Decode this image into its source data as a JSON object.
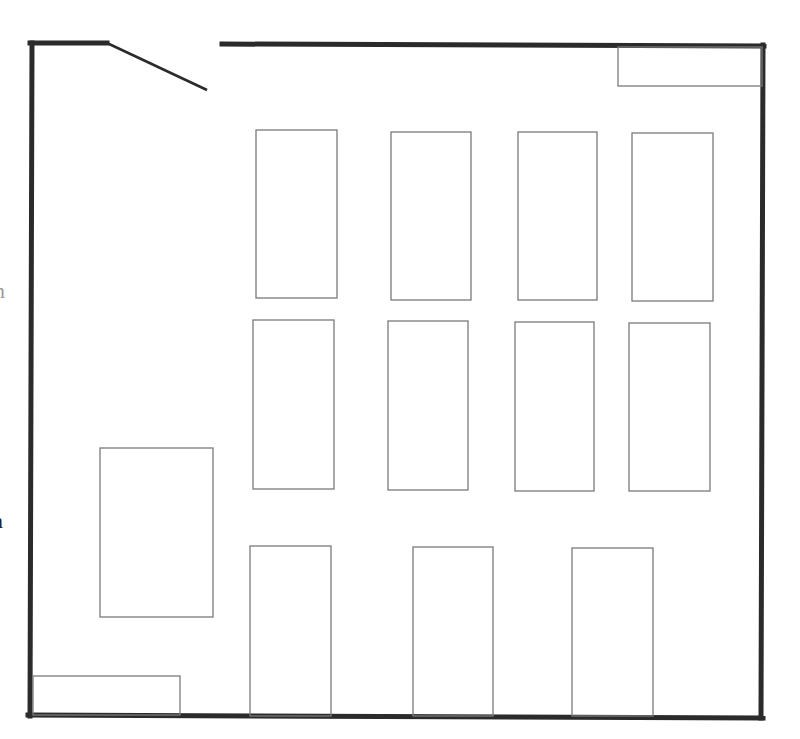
{
  "diagram": {
    "type": "floor-plan",
    "colors": {
      "background": "#ffffff",
      "wall": "#2b2b2b",
      "furniture_stroke": "#7a7a7a",
      "door": "#2b2b2b"
    },
    "walls": [
      {
        "id": "top-left-wall",
        "x1": 30,
        "y1": 43,
        "x2": 107,
        "y2": 43
      },
      {
        "id": "top-right-wall",
        "x1": 222,
        "y1": 44,
        "x2": 764,
        "y2": 46
      },
      {
        "id": "left-wall",
        "x1": 32,
        "y1": 43,
        "x2": 30,
        "y2": 716
      },
      {
        "id": "right-wall",
        "x1": 763,
        "y1": 45,
        "x2": 761,
        "y2": 718
      },
      {
        "id": "bottom-wall",
        "x1": 28,
        "y1": 715,
        "x2": 763,
        "y2": 718
      }
    ],
    "door": {
      "x1": 107,
      "y1": 43,
      "x2": 207,
      "y2": 90
    },
    "tables": [
      {
        "id": "row1-table1",
        "x": 256,
        "y": 130,
        "w": 81,
        "h": 168
      },
      {
        "id": "row1-table2",
        "x": 391,
        "y": 132,
        "w": 80,
        "h": 168
      },
      {
        "id": "row1-table3",
        "x": 518,
        "y": 132,
        "w": 79,
        "h": 168
      },
      {
        "id": "row1-table4",
        "x": 632,
        "y": 133,
        "w": 81,
        "h": 168
      },
      {
        "id": "row2-table1",
        "x": 253,
        "y": 320,
        "w": 81,
        "h": 169
      },
      {
        "id": "row2-table2",
        "x": 388,
        "y": 321,
        "w": 80,
        "h": 169
      },
      {
        "id": "row2-table3",
        "x": 515,
        "y": 322,
        "w": 79,
        "h": 169
      },
      {
        "id": "row2-table4",
        "x": 629,
        "y": 323,
        "w": 81,
        "h": 168
      },
      {
        "id": "row3-table1",
        "x": 250,
        "y": 546,
        "w": 81,
        "h": 170
      },
      {
        "id": "row3-table2",
        "x": 413,
        "y": 547,
        "w": 80,
        "h": 169
      },
      {
        "id": "row3-table3",
        "x": 572,
        "y": 548,
        "w": 81,
        "h": 168
      }
    ],
    "furniture": [
      {
        "id": "large-desk",
        "x": 100,
        "y": 448,
        "w": 113,
        "h": 169
      },
      {
        "id": "top-right-counter",
        "x": 618,
        "y": 47,
        "w": 144,
        "h": 39
      },
      {
        "id": "bottom-left-counter",
        "x": 33,
        "y": 676,
        "w": 147,
        "h": 39
      }
    ],
    "clipped_labels": [
      {
        "id": "clipped-label-upper",
        "text": "n",
        "x": 2,
        "y": 280,
        "faint": true
      },
      {
        "id": "clipped-label-lower",
        "text": "n",
        "x": 0,
        "y": 510,
        "faint": false
      }
    ]
  }
}
